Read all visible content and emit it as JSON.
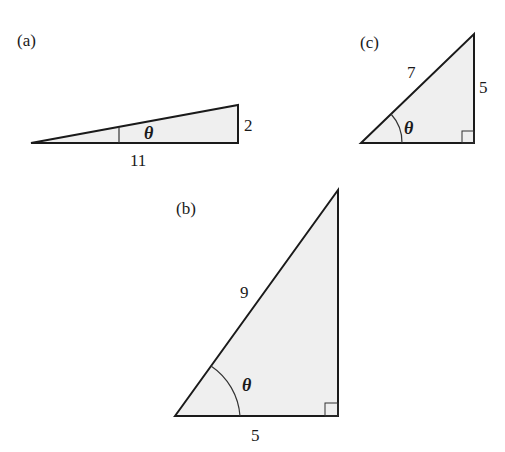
{
  "figures": [
    {
      "id": "a",
      "label": "(a)",
      "angle_symbol": "θ",
      "sides": {
        "adjacent": "11",
        "opposite": "2"
      },
      "right_angle_marked": false
    },
    {
      "id": "b",
      "label": "(b)",
      "angle_symbol": "θ",
      "sides": {
        "hypotenuse": "9",
        "adjacent": "5"
      },
      "right_angle_marked": true
    },
    {
      "id": "c",
      "label": "(c)",
      "angle_symbol": "θ",
      "sides": {
        "hypotenuse": "7",
        "opposite": "5"
      },
      "right_angle_marked": true
    }
  ],
  "colors": {
    "fill": "#efefef",
    "stroke": "#1a1a1a"
  }
}
